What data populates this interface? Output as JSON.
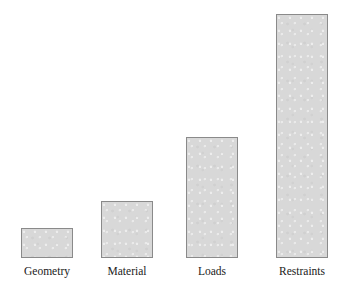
{
  "chart_data": {
    "type": "bar",
    "title": "",
    "subtitle": "",
    "xlabel": "",
    "ylabel": "",
    "categories": [
      "Geometry",
      "Material",
      "Loads",
      "Restraints"
    ],
    "values": [
      30,
      57,
      121,
      244
    ],
    "value_unit": "px",
    "ylim": [
      0,
      258
    ],
    "grid": false,
    "legend": null,
    "legend_position": "none",
    "annotations": [],
    "axis_visible": false,
    "tick_labels_y": [],
    "bars": [
      {
        "category": "Geometry",
        "value": 30,
        "height_px": 30,
        "left_px": 21,
        "top_px": 228,
        "width_px": 52
      },
      {
        "category": "Material",
        "value": 57,
        "height_px": 57,
        "left_px": 101,
        "top_px": 201,
        "width_px": 52
      },
      {
        "category": "Loads",
        "value": 121,
        "height_px": 121,
        "left_px": 186,
        "top_px": 137,
        "width_px": 52
      },
      {
        "category": "Restraints",
        "value": 244,
        "height_px": 244,
        "left_px": 276,
        "top_px": 14,
        "width_px": 52
      }
    ]
  },
  "style": {
    "background": "#ffffff",
    "bar_fill": "#d8d8d8",
    "bar_border": "#8a8a8a",
    "label_color": "#1a1a1a"
  }
}
